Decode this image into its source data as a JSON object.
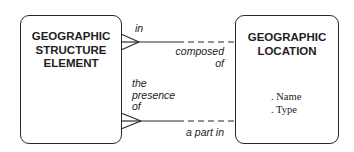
{
  "entities": {
    "left": {
      "title_lines": [
        "GEOGRAPHIC",
        "STRUCTURE",
        "ELEMENT"
      ],
      "attributes": []
    },
    "right": {
      "title_lines": [
        "GEOGRAPHIC",
        "LOCATION"
      ],
      "attributes": [
        ". Name",
        ". Type"
      ]
    }
  },
  "relationships": [
    {
      "from": "GEOGRAPHIC STRUCTURE ELEMENT",
      "to": "GEOGRAPHIC LOCATION",
      "from_label": "in",
      "to_label_lines": [
        "composed",
        "of"
      ],
      "from_cardinality": "many",
      "from_optionality": "mandatory",
      "to_optionality": "optional"
    },
    {
      "from": "GEOGRAPHIC STRUCTURE ELEMENT",
      "to": "GEOGRAPHIC LOCATION",
      "from_label_lines": [
        "the",
        "presence",
        "of"
      ],
      "to_label": "a part in",
      "from_cardinality": "many",
      "from_optionality": "mandatory",
      "to_optionality": "optional"
    }
  ],
  "colors": {
    "line": "#2a2a2a",
    "text": "#1e1e1e",
    "background": "#ffffff"
  }
}
